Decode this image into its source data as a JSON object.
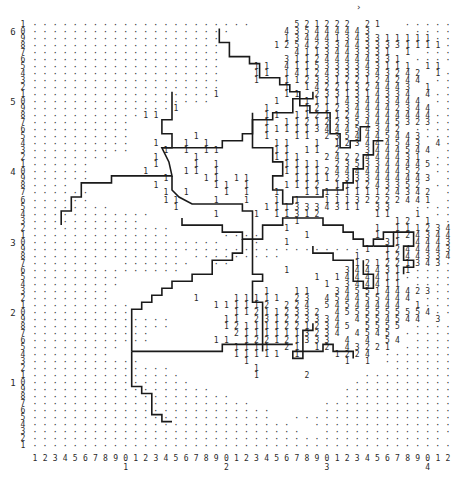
{
  "title": "",
  "corner_mark": "›",
  "grid": {
    "columns": 42,
    "row_max": 61,
    "row_min": 1,
    "legend_levels": [
      "1",
      "2",
      "3",
      "4",
      "5"
    ],
    "rows": [
      "......................    521222 21  ..........",
      "....................     435444443    ........",
      "...................      134441343311111......",
      "...................     12542334433331111.....",
      "...................       4113443331 1 .......",
      "...................      311244444331 .......",
      "...................   11 4115333343111 11 ....",
      "...................   11 14124333343242 1.....",
      "...................   1  11233122124244 ......",
      "...................      1 14221324443 1 .....",
      "..................1      11 2331314334 4....",
      "..................      1  111143443444 .....",
      "..............1        1   1212344442344 ....",
      "...........11          11 11211243444444.....",
      "..........             1 112122354445323.....",
      "..........             11111344454342 ......",
      "..........      1      1  11 2354445443......",
      "..........  1  1 1      11  1 123444543 4....",
      "..........   1 1 11     11 11 2  3444544 .....",
      "........    1   1       111  2422444431 .....",
      "......      1   1 1      1111 2353344445.....",
      "......     1   11 1      11112444444452 ....",
      "......       1   11 11    11112333444443 ...",
      "....        1     11 1   1112 111243352 ....",
      "......       1 1   1 1  1  1111111124342 ....",
      "......       11   1  1  1 1  11132222441 ...",
      "........      1        1113334311 33  ......",
      "............      1   1 11312     11  1 ....",
      "...........               1         12 1 ...",
      "..............           1        1 1112343 ..",
      "..............     ....    1      1 12434433.",
      "...................   .  1         31 44431 ..",
      ".................................1 12444431...",
      "............... .........       1  1244334..",
      ".......  .......  ..            121221343....",
      "...............          1     3444311.......",
      ".........                   1 1444411.......",
      ".........                    1 344411 ......",
      "........               1  11  3455144423.....",
      "........        1   11111 23 454455444 .....",
      "..........        111112 224 54544444 1.....",
      "..........          112112332 4555555554.....",
      "..............     11 231223334 4554544 3 ...",
      "..............     1211112212345 5555 .......",
      "............        21111113234 4545 ........",
      "............      11 122121333 4 4 54 ........",
      ".........           1111 21 12 43221 .........",
      "........            11111 1   1224 ..........",
      "...........          1         1 1 ..........",
      "..............        1             ..........",
      "...............       1    2     .............",
      "................                .............",
      "..................             ...............",
      "....................           ...............",
      "......................       ..................",
      "........................     ..................",
      "........................  ......................",
      "..........................  ....................",
      "...........................  ...................",
      ".........................................",
      "..........................................."
    ]
  },
  "y_axis": {
    "units_top_to_bottom": [
      "1",
      "0",
      "9",
      "8",
      "7",
      "6",
      "5",
      "4",
      "3",
      "2",
      "1",
      "0",
      "9",
      "8",
      "7",
      "6",
      "5",
      "4",
      "3",
      "2",
      "1",
      "0",
      "9",
      "8",
      "7",
      "6",
      "5",
      "4",
      "3",
      "2",
      "1",
      "0",
      "9",
      "8",
      "7",
      "6",
      "5",
      "4",
      "3",
      "2",
      "1",
      "0",
      "9",
      "8",
      "7",
      "6",
      "5",
      "4",
      "3",
      "2",
      "1",
      "0",
      "9",
      "8",
      "7",
      "6",
      "5",
      "4",
      "3",
      "2",
      "1"
    ],
    "tens": [
      {
        "row": 60,
        "label": "6"
      },
      {
        "row": 50,
        "label": "5"
      },
      {
        "row": 40,
        "label": "4"
      },
      {
        "row": 30,
        "label": "3"
      },
      {
        "row": 20,
        "label": "2"
      },
      {
        "row": 10,
        "label": "1"
      }
    ]
  },
  "x_axis": {
    "units": [
      "1",
      "2",
      "3",
      "4",
      "5",
      "6",
      "7",
      "8",
      "9",
      "0",
      "1",
      "2",
      "3",
      "4",
      "5",
      "6",
      "7",
      "8",
      "9",
      "0",
      "1",
      "2",
      "3",
      "4",
      "5",
      "6",
      "7",
      "8",
      "9",
      "0",
      "1",
      "2",
      "3",
      "4",
      "5",
      "6",
      "7",
      "8",
      "9",
      "0",
      "1",
      "2"
    ],
    "tens": [
      {
        "col": 10,
        "label": "1"
      },
      {
        "col": 20,
        "label": "2"
      },
      {
        "col": 30,
        "label": "3"
      },
      {
        "col": 40,
        "label": "4"
      }
    ]
  },
  "boundaries": [
    [
      [
        19.3,
        60.5
      ],
      [
        19.3,
        58.5
      ],
      [
        20.3,
        58.5
      ],
      [
        20.3,
        56.5
      ],
      [
        22.3,
        56.5
      ],
      [
        22.3,
        55.5
      ],
      [
        23.3,
        55.5
      ],
      [
        23.3,
        53.5
      ],
      [
        25.3,
        53.5
      ],
      [
        25.3,
        52.5
      ],
      [
        26.3,
        52.5
      ],
      [
        26.3,
        51.5
      ],
      [
        27.3,
        51.5
      ],
      [
        27.3,
        49.5
      ],
      [
        28.3,
        49.5
      ],
      [
        28.3,
        48.5
      ],
      [
        30.3,
        48.5
      ],
      [
        30.3,
        47.5
      ]
    ],
    [
      [
        14.6,
        51.5
      ],
      [
        14.6,
        47.5
      ],
      [
        13.6,
        47.5
      ],
      [
        13.6,
        45.5
      ],
      [
        14.6,
        45.5
      ],
      [
        14.6,
        43.5
      ],
      [
        13.6,
        43.5
      ],
      [
        14.3,
        41.5
      ],
      [
        14.6,
        39.5
      ],
      [
        8.6,
        39.5
      ],
      [
        8.6,
        38.5
      ],
      [
        5.6,
        38.5
      ],
      [
        5.6,
        36.5
      ],
      [
        4.6,
        36.5
      ],
      [
        4.6,
        34.5
      ],
      [
        3.6,
        34.5
      ],
      [
        3.6,
        32.5
      ]
    ],
    [
      [
        13.6,
        43.5
      ],
      [
        19.6,
        43.5
      ],
      [
        19.6,
        44.5
      ],
      [
        21.6,
        44.5
      ],
      [
        21.6,
        45.5
      ],
      [
        22.6,
        45.5
      ],
      [
        22.6,
        47.5
      ],
      [
        24.6,
        47.5
      ],
      [
        24.6,
        48.5
      ],
      [
        26.6,
        48.5
      ],
      [
        26.6,
        50.5
      ],
      [
        28.6,
        50.5
      ],
      [
        28.6,
        51.5
      ]
    ],
    [
      [
        14.6,
        39.5
      ],
      [
        14.6,
        37.5
      ],
      [
        15.3,
        36.5
      ],
      [
        16.6,
        35.5
      ],
      [
        21.6,
        35.5
      ],
      [
        21.6,
        34.5
      ],
      [
        22.6,
        34.5
      ],
      [
        22.6,
        33.5
      ]
    ],
    [
      [
        22.6,
        48.5
      ],
      [
        22.6,
        43.5
      ],
      [
        24.6,
        43.5
      ],
      [
        24.6,
        41.5
      ],
      [
        25.6,
        41.5
      ],
      [
        25.6,
        39.5
      ],
      [
        24.6,
        39.5
      ],
      [
        24.6,
        37.5
      ],
      [
        25.6,
        37.5
      ],
      [
        25.6,
        35.5
      ],
      [
        26.6,
        35.5
      ]
    ],
    [
      [
        15.6,
        33.5
      ],
      [
        15.6,
        32.5
      ],
      [
        19.6,
        32.5
      ],
      [
        19.6,
        31.5
      ],
      [
        21.6,
        31.5
      ],
      [
        21.6,
        30.5
      ],
      [
        23.6,
        30.5
      ],
      [
        23.6,
        32.5
      ],
      [
        25.6,
        32.5
      ],
      [
        25.6,
        33.5
      ],
      [
        29.6,
        33.5
      ],
      [
        29.6,
        32.5
      ],
      [
        31.6,
        32.5
      ],
      [
        31.6,
        31.5
      ],
      [
        32.6,
        31.5
      ],
      [
        32.6,
        30.5
      ],
      [
        33.6,
        30.5
      ],
      [
        33.6,
        29.5
      ],
      [
        34.6,
        29.5
      ]
    ],
    [
      [
        26.6,
        35.5
      ],
      [
        26.6,
        36.5
      ],
      [
        29.6,
        36.5
      ],
      [
        29.6,
        37.5
      ],
      [
        31.6,
        37.5
      ],
      [
        31.6,
        38.5
      ],
      [
        32.6,
        38.5
      ],
      [
        32.6,
        40.5
      ],
      [
        33.6,
        40.5
      ],
      [
        33.6,
        42.5
      ],
      [
        34.6,
        42.5
      ],
      [
        34.6,
        44.5
      ],
      [
        35.6,
        44.5
      ]
    ],
    [
      [
        28.6,
        18.5
      ],
      [
        28.6,
        17.5
      ],
      [
        27.6,
        17.5
      ],
      [
        27.6,
        13.5
      ],
      [
        26.6,
        13.5
      ],
      [
        26.6,
        14.5
      ],
      [
        29.6,
        14.5
      ],
      [
        29.6,
        15.5
      ],
      [
        30.6,
        15.5
      ],
      [
        30.6,
        14.5
      ],
      [
        32.6,
        14.5
      ],
      [
        32.6,
        13.5
      ]
    ],
    [
      [
        10.6,
        14.5
      ],
      [
        10.6,
        20.5
      ],
      [
        11.6,
        20.5
      ],
      [
        11.6,
        21.5
      ],
      [
        12.6,
        21.5
      ],
      [
        12.6,
        22.5
      ],
      [
        13.6,
        22.5
      ],
      [
        13.6,
        23.5
      ],
      [
        14.6,
        23.5
      ],
      [
        14.6,
        24.5
      ],
      [
        16.6,
        24.5
      ],
      [
        16.6,
        25.5
      ],
      [
        18.6,
        25.5
      ],
      [
        18.6,
        27.5
      ],
      [
        20.6,
        27.5
      ],
      [
        20.6,
        28.5
      ],
      [
        21.6,
        28.5
      ],
      [
        21.6,
        30.5
      ]
    ],
    [
      [
        10.6,
        14.5
      ],
      [
        19.6,
        14.5
      ],
      [
        19.6,
        15.5
      ],
      [
        26.6,
        15.5
      ]
    ],
    [
      [
        10.6,
        14.5
      ],
      [
        10.6,
        9.5
      ],
      [
        11.6,
        9.5
      ],
      [
        11.6,
        8.5
      ],
      [
        12.6,
        8.5
      ],
      [
        12.6,
        5.5
      ],
      [
        13.6,
        5.5
      ],
      [
        13.6,
        4.5
      ],
      [
        14.6,
        4.5
      ]
    ],
    [
      [
        22.6,
        33.5
      ],
      [
        22.6,
        25.5
      ],
      [
        23.6,
        25.5
      ],
      [
        23.6,
        24.5
      ],
      [
        22.6,
        24.5
      ],
      [
        22.6,
        21.5
      ],
      [
        23.6,
        21.5
      ],
      [
        23.6,
        14.5
      ]
    ],
    [
      [
        28.6,
        29.5
      ],
      [
        28.6,
        28.5
      ],
      [
        30.6,
        28.5
      ],
      [
        30.6,
        27.5
      ],
      [
        32.6,
        27.5
      ],
      [
        32.6,
        24.5
      ],
      [
        33.6,
        24.5
      ],
      [
        33.6,
        23.5
      ],
      [
        34.6,
        23.5
      ],
      [
        34.6,
        25.5
      ],
      [
        33.6,
        25.5
      ],
      [
        33.6,
        27.5
      ]
    ],
    [
      [
        34.6,
        29.5
      ],
      [
        36.6,
        29.5
      ],
      [
        36.6,
        31.5
      ],
      [
        35.6,
        31.5
      ],
      [
        35.6,
        30.5
      ],
      [
        34.6,
        30.5
      ],
      [
        34.6,
        29.5
      ]
    ],
    [
      [
        36.6,
        31.5
      ],
      [
        38.6,
        31.5
      ],
      [
        38.6,
        29.5
      ],
      [
        37.6,
        29.5
      ],
      [
        37.6,
        27.5
      ],
      [
        38.6,
        27.5
      ],
      [
        38.6,
        26.5
      ],
      [
        37.6,
        26.5
      ],
      [
        37.6,
        25.5
      ]
    ],
    [
      [
        30.3,
        47.5
      ],
      [
        30.3,
        45.5
      ],
      [
        31.3,
        45.5
      ],
      [
        31.3,
        43.5
      ],
      [
        32.3,
        43.5
      ],
      [
        32.3,
        44.5
      ],
      [
        33.3,
        44.5
      ],
      [
        33.3,
        46.5
      ],
      [
        34.3,
        46.5
      ]
    ]
  ]
}
